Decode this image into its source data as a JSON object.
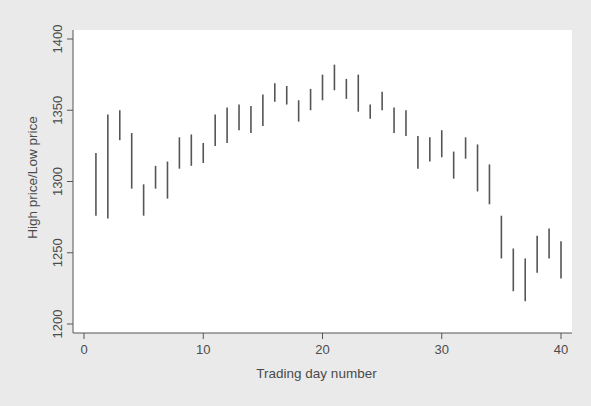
{
  "chart_data": {
    "type": "range-bar",
    "title": "",
    "xlabel": "Trading day number",
    "ylabel": "High price/Low price",
    "xlim": [
      0,
      40
    ],
    "ylim": [
      1200,
      1400
    ],
    "xticks": [
      0,
      10,
      20,
      30,
      40
    ],
    "yticks": [
      1200,
      1250,
      1300,
      1350,
      1400
    ],
    "grid": false,
    "legend": "none",
    "colors": {
      "outer_background": "#eaeaea",
      "plot_background": "#ffffff",
      "bars": "#555555",
      "axis": "#555555"
    },
    "series": [
      {
        "name": "High price",
        "values": [
          1320,
          1347,
          1350,
          1334,
          1298,
          1311,
          1314,
          1331,
          1333,
          1327,
          1347,
          1352,
          1354,
          1353,
          1361,
          1369,
          1367,
          1357,
          1365,
          1375,
          1382,
          1372,
          1375,
          1354,
          1363,
          1352,
          1350,
          1332,
          1331,
          1336,
          1321,
          1331,
          1326,
          1312,
          1276,
          1253,
          1246,
          1262,
          1267,
          1258
        ]
      },
      {
        "name": "Low price",
        "values": [
          1276,
          1274,
          1329,
          1295,
          1276,
          1295,
          1288,
          1309,
          1311,
          1313,
          1325,
          1327,
          1336,
          1334,
          1339,
          1356,
          1354,
          1342,
          1350,
          1357,
          1364,
          1358,
          1349,
          1344,
          1350,
          1334,
          1332,
          1309,
          1314,
          1317,
          1302,
          1316,
          1293,
          1284,
          1246,
          1223,
          1216,
          1236,
          1246,
          1232
        ]
      }
    ],
    "x": [
      1,
      2,
      3,
      4,
      5,
      6,
      7,
      8,
      9,
      10,
      11,
      12,
      13,
      14,
      15,
      16,
      17,
      18,
      19,
      20,
      21,
      22,
      23,
      24,
      25,
      26,
      27,
      28,
      29,
      30,
      31,
      32,
      33,
      34,
      35,
      36,
      37,
      38,
      39,
      40
    ]
  }
}
